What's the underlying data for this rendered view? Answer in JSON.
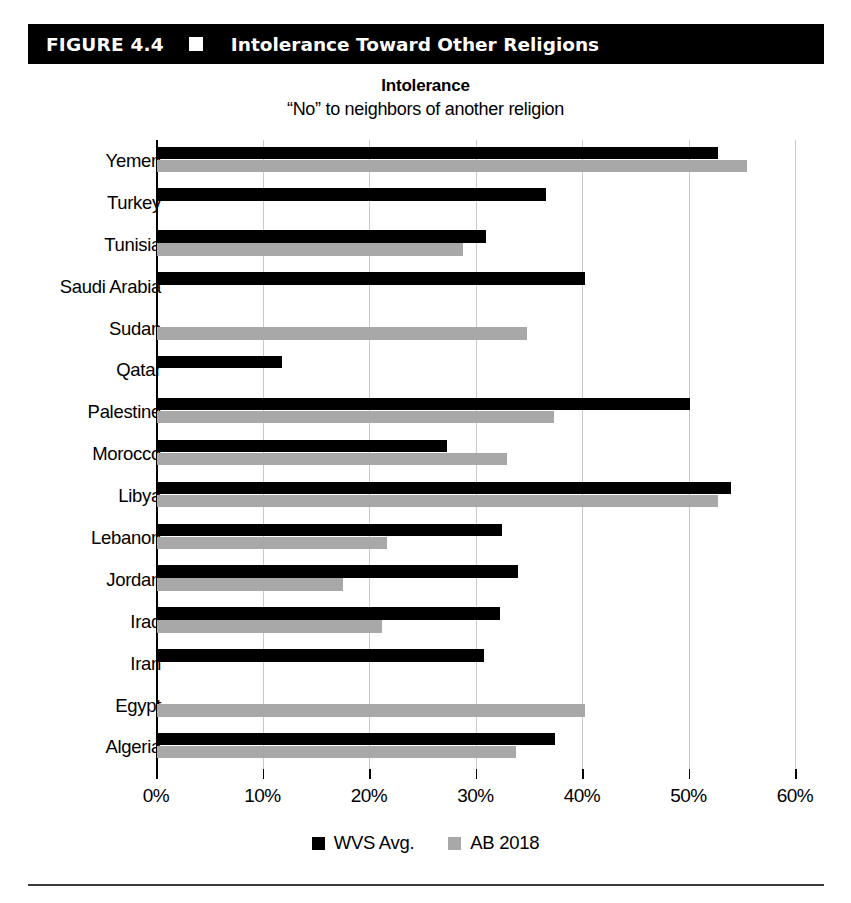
{
  "figure": {
    "number": "FIGURE 4.4",
    "marker_icon": "white-square-icon",
    "title": "Intolerance Toward Other Religions"
  },
  "chart_data": {
    "type": "bar",
    "orientation": "horizontal",
    "title": "Intolerance",
    "subtitle": "“No” to neighbors of another religion",
    "xlabel": "",
    "ylabel": "",
    "xlim": [
      0,
      60
    ],
    "xticks": [
      "0%",
      "10%",
      "20%",
      "30%",
      "40%",
      "50%",
      "60%"
    ],
    "xtick_values": [
      0,
      10,
      20,
      30,
      40,
      50,
      60
    ],
    "grid": true,
    "legend_position": "bottom",
    "categories": [
      "Yemen",
      "Turkey",
      "Tunisia",
      "Saudi Arabia",
      "Sudan",
      "Qatar",
      "Palestine",
      "Morocco",
      "Libya",
      "Lebanon",
      "Jordan",
      "Iraq",
      "Iran",
      "Egypt",
      "Algeria"
    ],
    "series": [
      {
        "name": "WVS Avg.",
        "color": "#000000",
        "values": [
          52.7,
          36.5,
          30.9,
          40.2,
          null,
          11.7,
          50.0,
          27.2,
          53.9,
          32.4,
          33.9,
          32.2,
          30.7,
          null,
          37.4
        ]
      },
      {
        "name": "AB 2018",
        "color": "#a8a8a8",
        "values": [
          55.4,
          null,
          28.7,
          null,
          34.7,
          null,
          37.3,
          32.9,
          52.7,
          21.6,
          17.5,
          21.1,
          null,
          40.2,
          33.7
        ]
      }
    ]
  },
  "legend": {
    "items": [
      {
        "label": "WVS Avg.",
        "color": "#000000",
        "icon": "black-square-icon"
      },
      {
        "label": "AB 2018",
        "color": "#a8a8a8",
        "icon": "gray-square-icon"
      }
    ]
  },
  "colors": {
    "banner_background": "#000000",
    "banner_text": "#ffffff",
    "series_primary": "#000000",
    "series_secondary": "#a8a8a8",
    "gridline": "#c9c9c9"
  }
}
